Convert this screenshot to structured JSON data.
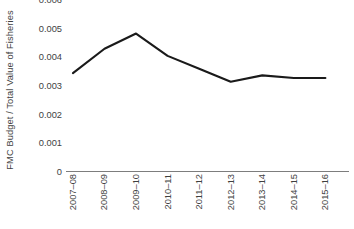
{
  "chart_data": {
    "type": "line",
    "title": "",
    "xlabel": "",
    "ylabel": "FMC Budget / Total Value of Fisheries",
    "categories": [
      "2007–08",
      "2008–09",
      "2009–10",
      "2010–11",
      "2011–12",
      "2012–13",
      "2013–14",
      "2014–15",
      "2015–16"
    ],
    "values": [
      0.00345,
      0.0043,
      0.00483,
      0.00405,
      0.0036,
      0.00315,
      0.00337,
      0.00328,
      0.00328
    ],
    "ylim": [
      0,
      0.006
    ],
    "yticks": [
      0,
      0.001,
      0.002,
      0.003,
      0.004,
      0.005,
      0.006
    ],
    "ytick_labels": [
      "0",
      "0.001",
      "0.002",
      "0.003",
      "0.004",
      "0.005",
      "0.006"
    ],
    "grid": false,
    "legend": "none",
    "series": [
      {
        "name": "FMC Budget / Total Value of Fisheries",
        "color": "#1a1a1a",
        "values": [
          0.00345,
          0.0043,
          0.00483,
          0.00405,
          0.0036,
          0.00315,
          0.00337,
          0.00328,
          0.00328
        ]
      }
    ],
    "axis_color": "#7d7d7d",
    "text_color": "#3f3f3f",
    "background": "#ffffff"
  }
}
